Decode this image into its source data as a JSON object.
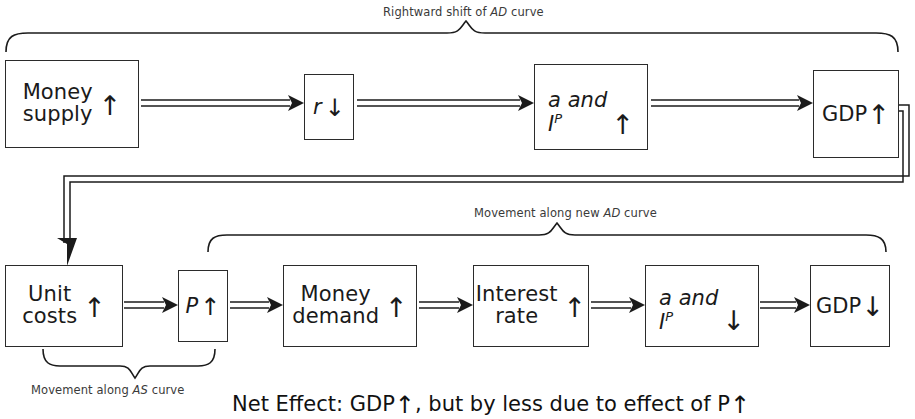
{
  "diagram": {
    "title_top": "Rightward shift of AD curve",
    "title_top_plain": "Rightward shift of ",
    "title_top_italic": "AD",
    "title_top_tail": " curve",
    "caption_mid_plain": "Movement along new ",
    "caption_mid_italic": "AD",
    "caption_mid_tail": " curve",
    "caption_as_plain": "Movement along ",
    "caption_as_italic": "AS",
    "caption_as_tail": " curve",
    "net_effect": "Net Effect: GDP",
    "net_effect_arrow1": "↑",
    "net_effect_mid": ", but by less due to effect of P",
    "net_effect_arrow2": "↑"
  },
  "arrows": {
    "up": "↑",
    "down": "↓"
  },
  "top_row": [
    {
      "id": "money-supply",
      "line1": "Money",
      "line2": "supply",
      "direction": "↑"
    },
    {
      "id": "interest-rate-r",
      "line1": "r",
      "line2": "",
      "direction": "↓"
    },
    {
      "id": "a-and-ip-up",
      "line1": "a and",
      "line2": "I",
      "superscript": "P",
      "direction": "↑"
    },
    {
      "id": "gdp-up",
      "line1": "GDP",
      "line2": "",
      "direction": "↑"
    }
  ],
  "bottom_row": [
    {
      "id": "unit-costs",
      "line1": "Unit",
      "line2": "costs",
      "direction": "↑"
    },
    {
      "id": "price-level",
      "line1": "P",
      "line2": "",
      "direction": "↑"
    },
    {
      "id": "money-demand",
      "line1": "Money",
      "line2": "demand",
      "direction": "↑"
    },
    {
      "id": "interest-rate",
      "line1": "Interest",
      "line2": "rate",
      "direction": "↑"
    },
    {
      "id": "a-and-ip-down",
      "line1": "a and",
      "line2": "I",
      "superscript": "P",
      "direction": "↓"
    },
    {
      "id": "gdp-down",
      "line1": "GDP",
      "line2": "",
      "direction": "↓"
    }
  ],
  "colors": {
    "ink": "#2b2b2b",
    "caption": "#3a3a3a",
    "background": "#ffffff"
  }
}
